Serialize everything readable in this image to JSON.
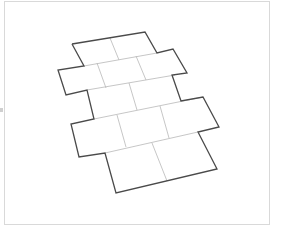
{
  "diagram": {
    "rows": [
      {
        "row": 1,
        "tiles": 2
      },
      {
        "row": 2,
        "tiles": 3
      },
      {
        "row": 3,
        "tiles": 2
      },
      {
        "row": 4,
        "tiles": 3
      },
      {
        "row": 5,
        "tiles": 2
      }
    ],
    "colors": {
      "outline": "#4a4a4a",
      "inner_lines": "#b8b8b8",
      "frame_border": "#d9d9d9",
      "background": "#ffffff"
    }
  }
}
